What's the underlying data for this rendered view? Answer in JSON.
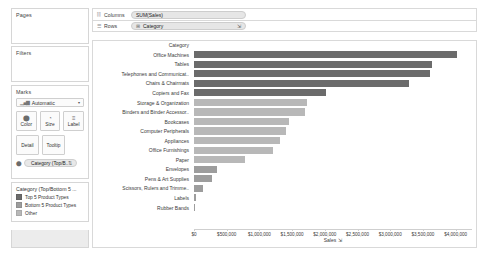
{
  "sidebar": {
    "pages": {
      "title": "Pages"
    },
    "filters": {
      "title": "Filters"
    },
    "marks": {
      "title": "Marks",
      "mark_type": "Automatic",
      "mark_type_icon": "bar-mark-icon",
      "caret_icon": "chevron-down-icon",
      "buttons": [
        {
          "label": "Color",
          "icon": "color-icon"
        },
        {
          "label": "Size",
          "icon": "size-icon"
        },
        {
          "label": "Label",
          "icon": "label-icon"
        },
        {
          "label": "Detail",
          "icon": "detail-icon"
        },
        {
          "label": "Tooltip",
          "icon": "tooltip-icon"
        }
      ],
      "color_pill": {
        "label": "Category (Top/B..",
        "icon": "color-icon",
        "sort_icon": "sort-icon"
      }
    },
    "legend": {
      "title": "Category (Top/Bottom 5 ...",
      "items": [
        {
          "label": "Top 5 Product Types",
          "color": "#6b6b6b"
        },
        {
          "label": "Bottom 5 Product Types",
          "color": "#9d9d9d"
        },
        {
          "label": "Other",
          "color": "#b8b8b8"
        }
      ]
    }
  },
  "shelves": {
    "columns": {
      "name": "Columns",
      "icon": "columns-icon",
      "pill": {
        "label": "SUM(Sales)",
        "icon": ""
      }
    },
    "rows": {
      "name": "Rows",
      "icon": "rows-icon",
      "pill": {
        "label": "Category",
        "icon": "plus-icon",
        "sort_icon": "sort-icon"
      }
    }
  },
  "chart_data": {
    "type": "bar",
    "title": "",
    "orientation": "horizontal",
    "column_header": "Category",
    "xlabel": "Sales",
    "xlabel_sort_icon": "sort-icon",
    "ylabel": "",
    "xlim": [
      0,
      4250000
    ],
    "grid": false,
    "legend_position": "sidebar",
    "tick_labels": [
      "$0",
      "$500,000",
      "$1,000,000",
      "$1,500,000",
      "$2,000,000",
      "$2,500,000",
      "$3,000,000",
      "$3,500,000",
      "$4,000,000"
    ],
    "ticks": [
      0,
      500000,
      1000000,
      1500000,
      2000000,
      2500000,
      3000000,
      3500000,
      4000000
    ],
    "categories": [
      "Office Machines",
      "Tables",
      "Telephones and Communicat..",
      "Chairs & Chairmats",
      "Copiers and Fax",
      "Storage & Organization",
      "Binders and Binder Accessor..",
      "Bookcases",
      "Computer Peripherals",
      "Appliances",
      "Office Furnishings",
      "Paper",
      "Envelopes",
      "Pens & Art Supplies",
      "Scissors, Rulers and Trimme..",
      "Labels",
      "Rubber Bands"
    ],
    "values": [
      3970000,
      3580000,
      3560000,
      3240000,
      1990000,
      1700000,
      1680000,
      1430000,
      1390000,
      1300000,
      1190000,
      770000,
      350000,
      270000,
      140000,
      30000,
      12000
    ],
    "series": [
      {
        "name": "Top 5 Product Types",
        "color": "#6b6b6b",
        "members": [
          "Office Machines",
          "Tables",
          "Telephones and Communicat..",
          "Chairs & Chairmats",
          "Copiers and Fax"
        ]
      },
      {
        "name": "Bottom 5 Product Types",
        "color": "#9d9d9d",
        "members": [
          "Envelopes",
          "Pens & Art Supplies",
          "Scissors, Rulers and Trimme..",
          "Labels",
          "Rubber Bands"
        ]
      },
      {
        "name": "Other",
        "color": "#b8b8b8",
        "members": [
          "Storage & Organization",
          "Binders and Binder Accessor..",
          "Bookcases",
          "Computer Peripherals",
          "Appliances",
          "Office Furnishings",
          "Paper"
        ]
      }
    ],
    "bar_colors": [
      "#6b6b6b",
      "#6b6b6b",
      "#6b6b6b",
      "#6b6b6b",
      "#6b6b6b",
      "#b8b8b8",
      "#b8b8b8",
      "#b8b8b8",
      "#b8b8b8",
      "#b8b8b8",
      "#b8b8b8",
      "#b8b8b8",
      "#9d9d9d",
      "#9d9d9d",
      "#9d9d9d",
      "#9d9d9d",
      "#9d9d9d"
    ]
  }
}
